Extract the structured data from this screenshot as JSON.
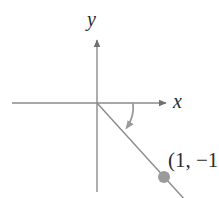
{
  "figure": {
    "type": "coordinate-plane-diagram",
    "width": 219,
    "height": 198,
    "background_color": "#ffffff",
    "axis_color": "#8a8a8a",
    "ray_color": "#8a8a8a",
    "arc_color": "#9a9a9a",
    "point_color": "#9b9b9b",
    "text_color": "#2b2b2b"
  },
  "axes": {
    "x_label": "x",
    "y_label": "y",
    "origin": {
      "x": 97,
      "y": 103
    },
    "x_axis": {
      "start_x": 12,
      "end_x": 168,
      "y": 103,
      "arrow": "right"
    },
    "y_axis": {
      "x": 97,
      "start_y": 38,
      "end_y": 192,
      "arrow": "up"
    }
  },
  "ray": {
    "from": {
      "x": 97,
      "y": 103
    },
    "through": {
      "x": 164,
      "y": 177
    },
    "to": {
      "x": 195,
      "y": 211
    }
  },
  "angle_arc": {
    "start": {
      "x": 133,
      "y": 103
    },
    "end": {
      "x": 127,
      "y": 131
    },
    "arrow": "end",
    "direction": "clockwise"
  },
  "point": {
    "label": "(1, −1",
    "marker": {
      "x": 164,
      "y": 177,
      "radius": 6
    }
  }
}
